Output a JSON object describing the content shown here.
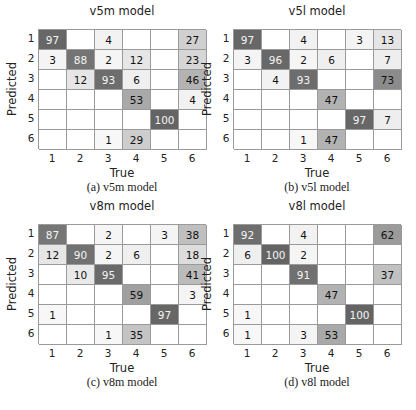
{
  "chart_data": [
    {
      "type": "heatmap",
      "title": "v5m model",
      "caption": "(a) v5m model",
      "xlabel": "True",
      "ylabel": "Predicted",
      "x_ticks": [
        "1",
        "2",
        "3",
        "4",
        "5",
        "6"
      ],
      "y_ticks": [
        "1",
        "2",
        "3",
        "4",
        "5",
        "6"
      ],
      "matrix": [
        [
          97,
          null,
          4,
          null,
          null,
          27
        ],
        [
          3,
          88,
          2,
          12,
          null,
          23
        ],
        [
          null,
          12,
          93,
          6,
          null,
          46
        ],
        [
          null,
          null,
          null,
          53,
          null,
          4
        ],
        [
          null,
          null,
          null,
          null,
          100,
          null
        ],
        [
          null,
          null,
          1,
          29,
          null,
          null
        ]
      ]
    },
    {
      "type": "heatmap",
      "title": "v5l model",
      "caption": "(b) v5l model",
      "xlabel": "True",
      "ylabel": "Predicted",
      "x_ticks": [
        "1",
        "2",
        "3",
        "4",
        "5",
        "6"
      ],
      "y_ticks": [
        "1",
        "2",
        "3",
        "4",
        "5",
        "6"
      ],
      "matrix": [
        [
          97,
          null,
          4,
          null,
          3,
          13
        ],
        [
          3,
          96,
          2,
          6,
          null,
          7
        ],
        [
          null,
          4,
          93,
          null,
          null,
          73
        ],
        [
          null,
          null,
          null,
          47,
          null,
          null
        ],
        [
          null,
          null,
          null,
          null,
          97,
          7
        ],
        [
          null,
          null,
          1,
          47,
          null,
          null
        ]
      ]
    },
    {
      "type": "heatmap",
      "title": "v8m model",
      "caption": "(c) v8m model",
      "xlabel": "True",
      "ylabel": "Predicted",
      "x_ticks": [
        "1",
        "2",
        "3",
        "4",
        "5",
        "6"
      ],
      "y_ticks": [
        "1",
        "2",
        "3",
        "4",
        "5",
        "6"
      ],
      "matrix": [
        [
          87,
          null,
          2,
          null,
          3,
          38
        ],
        [
          12,
          90,
          2,
          6,
          null,
          18
        ],
        [
          null,
          10,
          95,
          null,
          null,
          41
        ],
        [
          null,
          null,
          null,
          59,
          null,
          3
        ],
        [
          1,
          null,
          null,
          null,
          97,
          null
        ],
        [
          null,
          null,
          1,
          35,
          null,
          null
        ]
      ]
    },
    {
      "type": "heatmap",
      "title": "v8l model",
      "caption": "(d) v8l model",
      "xlabel": "True",
      "ylabel": "Predicted",
      "x_ticks": [
        "1",
        "2",
        "3",
        "4",
        "5",
        "6"
      ],
      "y_ticks": [
        "1",
        "2",
        "3",
        "4",
        "5",
        "6"
      ],
      "matrix": [
        [
          92,
          null,
          4,
          null,
          null,
          62
        ],
        [
          6,
          100,
          2,
          null,
          null,
          null
        ],
        [
          null,
          null,
          91,
          null,
          null,
          37
        ],
        [
          null,
          null,
          null,
          47,
          null,
          null
        ],
        [
          1,
          null,
          null,
          null,
          100,
          null
        ],
        [
          1,
          null,
          3,
          53,
          null,
          null
        ]
      ]
    }
  ],
  "panels": [
    {
      "title": "v5m model",
      "caption": "(a) v5m model",
      "xlabel": "True",
      "ylabel": "Predicted"
    },
    {
      "title": "v5l model",
      "caption": "(b) v5l model",
      "xlabel": "True",
      "ylabel": "Predicted"
    },
    {
      "title": "v8m model",
      "caption": "(c) v8m model",
      "xlabel": "True",
      "ylabel": "Predicted"
    },
    {
      "title": "v8l model",
      "caption": "(d) v8l model",
      "xlabel": "True",
      "ylabel": "Predicted"
    }
  ],
  "colors": {
    "high": "#666666",
    "mid": "#aaaaaa",
    "low": "#f2f2f2",
    "grid_line": "#9a9a9a",
    "text_dark": "#111111",
    "text_light": "#ffffff"
  }
}
